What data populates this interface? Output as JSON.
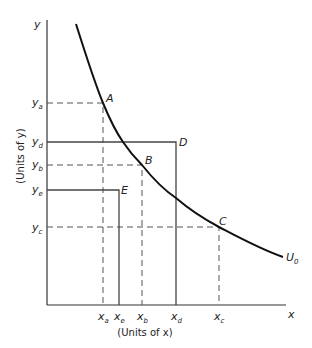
{
  "diagram": {
    "type": "indifference-curve",
    "axes": {
      "y_label": "y",
      "x_label": "x",
      "y_caption": "(Units of y)",
      "x_caption": "(Units of x)"
    },
    "curve": {
      "label": "U",
      "label_sub": "0"
    },
    "points": [
      {
        "name": "A",
        "x_tick": "a",
        "y_tick": "a",
        "on_curve": true,
        "lines": "dashed"
      },
      {
        "name": "B",
        "x_tick": "b",
        "y_tick": "b",
        "on_curve": true,
        "lines": "dashed"
      },
      {
        "name": "C",
        "x_tick": "c",
        "y_tick": "c",
        "on_curve": true,
        "lines": "dashed"
      },
      {
        "name": "D",
        "x_tick": "d",
        "y_tick": "d",
        "on_curve": false,
        "lines": "solid"
      },
      {
        "name": "E",
        "x_tick": "e",
        "y_tick": "e",
        "on_curve": false,
        "lines": "solid"
      }
    ],
    "y_ticks_top_to_bottom": [
      "y_a",
      "y_d",
      "y_b",
      "y_e",
      "y_c"
    ],
    "x_ticks_left_to_right": [
      "x_a",
      "x_e",
      "x_b",
      "x_d",
      "x_c"
    ],
    "labels": {
      "A": "A",
      "B": "B",
      "C": "C",
      "D": "D",
      "E": "E",
      "y": "y",
      "x": "x",
      "a": "a",
      "b": "b",
      "c": "c",
      "d": "d",
      "e": "e"
    }
  }
}
